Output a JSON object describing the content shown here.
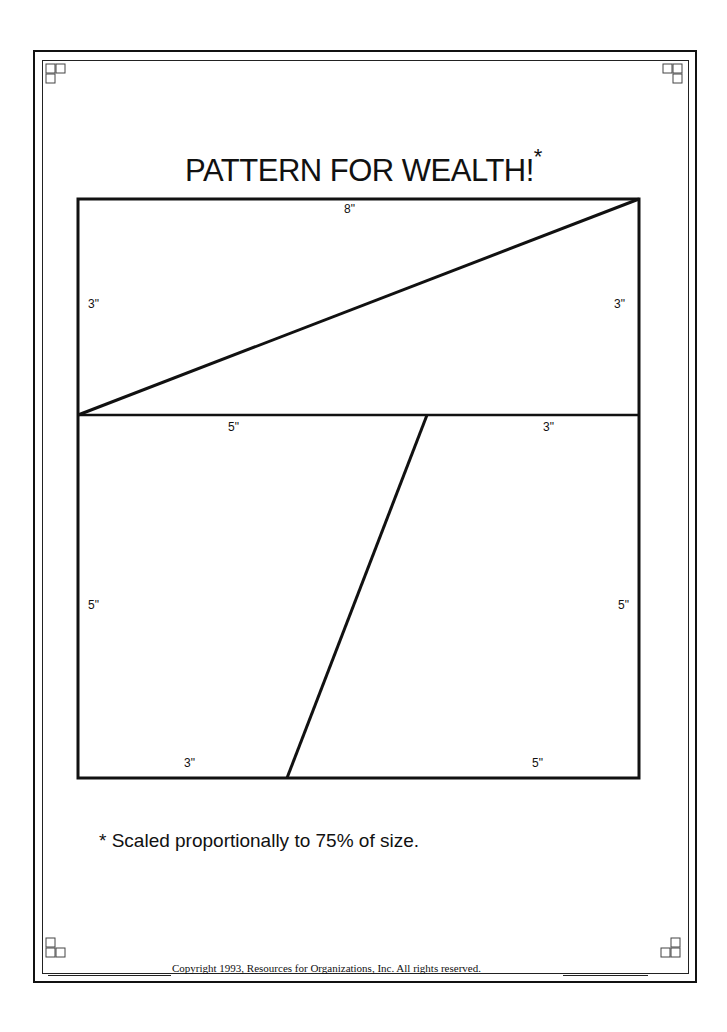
{
  "document": {
    "title": "PATTERN FOR WEALTH!",
    "title_mark": "*",
    "footnote": "* Scaled proportionally to 75% of size.",
    "copyright": "Copyright 1993, Resources for Organizations, Inc.  All rights reserved."
  },
  "pattern": {
    "unit": "inches",
    "overall": {
      "width": 8,
      "height": 8
    },
    "upper_rectangle": {
      "width": 8,
      "height": 3,
      "labels": {
        "top": "8\"",
        "left": "3\"",
        "right": "3\""
      },
      "cut": "diagonal from bottom-left to top-right"
    },
    "lower_rectangle": {
      "width": 8,
      "height": 5,
      "labels": {
        "top_left": "5\"",
        "top_right": "3\"",
        "left": "5\"",
        "right": "5\"",
        "bottom_left": "3\"",
        "bottom_right": "5\""
      },
      "cut": "slanted line from 5\" mark on top to 3\" mark on bottom"
    }
  },
  "decorations": {
    "corner_icon": "three-square-knot-motif"
  }
}
